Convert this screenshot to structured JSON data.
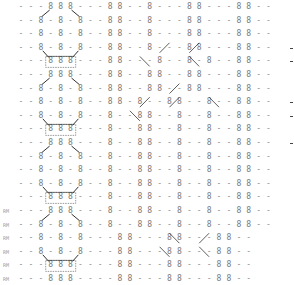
{
  "chart": {
    "symbols": {
      "purl": "-",
      "knit": "8"
    },
    "grid": {
      "x0": 21,
      "dx": 9.9,
      "y0": 1,
      "dy": 13.6
    },
    "rows": [
      {
        "label": "",
        "cells": "---888---88--8---88---88--"
      },
      {
        "label": "",
        "cells": "--8-8-8--88--8---88---88--"
      },
      {
        "label": "",
        "cells": "--8-8-8--88--8---88---88--"
      },
      {
        "label": "",
        "cells": "--8-8-8--88--8---88---88--"
      },
      {
        "label": "",
        "cells": "---888---88---8--8-8--88--"
      },
      {
        "label": "",
        "cells": "---888---88--88--88---88--"
      },
      {
        "label": "",
        "cells": "--8-8-8--88--88--88---88--"
      },
      {
        "label": "",
        "cells": "--8-8-8--88-8--88--8--88--"
      },
      {
        "label": "",
        "cells": "--8-8-8--8--88--8--8--88--"
      },
      {
        "label": "",
        "cells": "---888---8--88--8--8--88--"
      },
      {
        "label": "",
        "cells": "---888---8--88--8--8--88--"
      },
      {
        "label": "",
        "cells": "--8-8-8--8--88--8--8--88--"
      },
      {
        "label": "",
        "cells": "--8-8-8--8--88--8--8--88--"
      },
      {
        "label": "",
        "cells": "--8-8-8--8--88--8--8--88--"
      },
      {
        "label": "",
        "cells": "---888---8--88--8--8--88--"
      },
      {
        "label": "RM",
        "cells": "---888---8--88--8--8--88--"
      },
      {
        "label": "RM",
        "cells": "--8-8-8--8--88--8--8--88--"
      },
      {
        "label": "RM",
        "cells": "--8-8-8---88---88---88--"
      },
      {
        "label": "RM",
        "cells": "--8-8-8---88---88---88--"
      },
      {
        "label": "RM",
        "cells": "---888----88---88---88--"
      },
      {
        "label": "RM",
        "cells": "---888----88---88---88--"
      }
    ],
    "highlighted_boxes": [
      4,
      9,
      14,
      19
    ],
    "right_marks": [
      3,
      4,
      7,
      8,
      10
    ]
  }
}
